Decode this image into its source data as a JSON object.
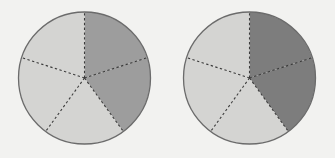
{
  "figure": {
    "background_color": "#f2f2f0",
    "width": 335,
    "height": 158
  },
  "chart_data": {
    "type": "pie",
    "title": "",
    "subtitle": "",
    "xlabel": "",
    "ylabel": "",
    "legend": [],
    "grid": false,
    "charts": [
      {
        "name": "left-circle",
        "center_x": 84.5,
        "center_y": 78,
        "radius": 66,
        "sectors": 5,
        "sector_angle_degrees": 72,
        "start_angle_degrees": -90,
        "shaded_count": 2,
        "unshaded_count": 5,
        "fraction_shaded": "2/5",
        "categories": [
          "sector-1",
          "sector-2",
          "sector-3",
          "sector-4",
          "sector-5"
        ],
        "values": [
          72,
          72,
          72,
          72,
          72
        ],
        "slice_fills": [
          "#9d9d9d",
          "#9d9d9d",
          "#d4d4d2",
          "#d4d4d2",
          "#d4d4d2"
        ]
      },
      {
        "name": "right-circle",
        "center_x": 249.5,
        "center_y": 78,
        "radius": 66,
        "sectors": 5,
        "sector_angle_degrees": 72,
        "start_angle_degrees": -90,
        "shaded_count": 2,
        "unshaded_count": 5,
        "fraction_shaded": "2/5",
        "categories": [
          "sector-1",
          "sector-2",
          "sector-3",
          "sector-4",
          "sector-5"
        ],
        "values": [
          72,
          72,
          72,
          72,
          72
        ],
        "slice_fills": [
          "#7d7d7d",
          "#7d7d7d",
          "#d4d4d2",
          "#d4d4d2",
          "#d4d4d2"
        ]
      }
    ],
    "colors": {
      "shade_medium": "#9d9d9d",
      "shade_dark": "#7d7d7d",
      "shade_light": "#d4d4d2",
      "outline": "#6b6b6b",
      "divider": "#3c3c3c",
      "background": "#f2f2f0"
    }
  }
}
